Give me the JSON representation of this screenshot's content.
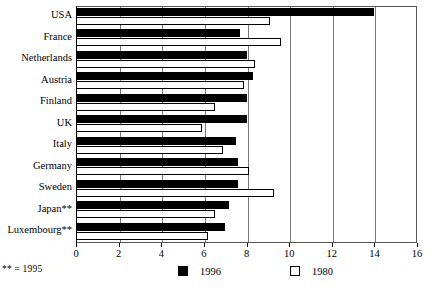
{
  "chart_data": {
    "type": "bar",
    "orientation": "horizontal",
    "title": "",
    "xlabel": "",
    "ylabel": "",
    "xlim": [
      0,
      16
    ],
    "xticks": [
      0,
      2,
      4,
      6,
      8,
      10,
      12,
      14,
      16
    ],
    "grid": true,
    "legend_position": "bottom",
    "categories": [
      "USA",
      "France",
      "Netherlands",
      "Austria",
      "Finland",
      "UK",
      "Italy",
      "Germany",
      "Sweden",
      "Japan**",
      "Luxembourg**"
    ],
    "series": [
      {
        "name": "1996",
        "color": "#000000",
        "values": [
          14.0,
          7.7,
          8.0,
          8.3,
          8.0,
          8.0,
          7.5,
          7.6,
          7.6,
          7.2,
          7.0
        ]
      },
      {
        "name": "1980",
        "color": "#ffffff",
        "values": [
          9.1,
          9.6,
          8.4,
          7.9,
          6.5,
          5.9,
          6.9,
          8.1,
          9.3,
          6.5,
          6.2
        ]
      }
    ],
    "annotations": [
      "** = 1995"
    ]
  },
  "axis": {
    "tick_labels": [
      "0",
      "2",
      "4",
      "6",
      "8",
      "10",
      "12",
      "14",
      "16"
    ]
  },
  "legend": {
    "items": [
      {
        "label": "1996",
        "swatch": "filled-square"
      },
      {
        "label": "1980",
        "swatch": "hollow-square"
      }
    ]
  },
  "footnote": {
    "text": "** = 1995"
  },
  "caption": {
    "text": ""
  }
}
